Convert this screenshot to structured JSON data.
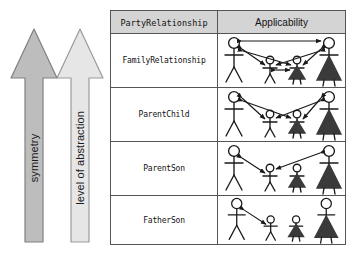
{
  "diagram": {
    "title_hidden": "",
    "axes": [
      {
        "id": "symmetry",
        "label": "symmetry",
        "color": "#bdbdbd",
        "stroke": "#808080",
        "direction": "up"
      },
      {
        "id": "level-of-abstraction",
        "label": "level of abstraction",
        "color": "#e2e2e2",
        "stroke": "#9a9a9a",
        "direction": "up"
      }
    ],
    "table": {
      "header": {
        "col1": "PartyRelationship",
        "col2": "Applicability",
        "background": "#d4d4d4"
      },
      "rows": [
        {
          "label": "FamilyRelationship",
          "figures": [
            "father",
            "son",
            "daughter",
            "mother"
          ],
          "relationships": [
            {
              "from": "father",
              "to": "mother",
              "symmetric": true
            },
            {
              "from": "father",
              "to": "son",
              "symmetric": true
            },
            {
              "from": "father",
              "to": "daughter",
              "symmetric": true
            },
            {
              "from": "mother",
              "to": "son",
              "symmetric": true
            },
            {
              "from": "mother",
              "to": "daughter",
              "symmetric": true
            },
            {
              "from": "son",
              "to": "daughter",
              "symmetric": true
            }
          ]
        },
        {
          "label": "ParentChild",
          "figures": [
            "father",
            "son",
            "daughter",
            "mother"
          ],
          "relationships": [
            {
              "from": "father",
              "to": "son",
              "symmetric": true
            },
            {
              "from": "father",
              "to": "daughter",
              "symmetric": true
            },
            {
              "from": "mother",
              "to": "son",
              "symmetric": true
            },
            {
              "from": "mother",
              "to": "daughter",
              "symmetric": true
            }
          ]
        },
        {
          "label": "ParentSon",
          "figures": [
            "father",
            "son",
            "daughter",
            "mother"
          ],
          "relationships": [
            {
              "from": "father",
              "to": "son",
              "symmetric": true
            },
            {
              "from": "mother",
              "to": "son",
              "symmetric": true
            }
          ]
        },
        {
          "label": "FatherSon",
          "figures": [
            "father",
            "son",
            "daughter",
            "mother"
          ],
          "relationships": [
            {
              "from": "father",
              "to": "son",
              "symmetric": true
            }
          ]
        }
      ]
    },
    "colors": {
      "line": "#1a1a1a",
      "border": "#555555",
      "skirt_fill": "#3a3a3a",
      "page_bg": "#ffffff"
    }
  }
}
